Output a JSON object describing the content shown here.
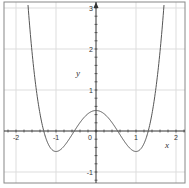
{
  "chart_data": {
    "type": "line",
    "title": "",
    "xlabel": "x",
    "ylabel": "y",
    "function": "y = x^4 - 2x^2 + 0.5",
    "xlim": [
      -2.3,
      2.23
    ],
    "ylim": [
      -1.27,
      3.15
    ],
    "grid": true,
    "x_ticks": [
      -2,
      -1,
      0,
      1,
      2
    ],
    "x_tick_labels": [
      "-2",
      "-1",
      "0",
      "1",
      "2"
    ],
    "y_ticks": [
      -1,
      1,
      2,
      3
    ],
    "y_tick_labels": [
      "-1",
      "1",
      "2",
      "3"
    ],
    "series": [
      {
        "name": "f(x)",
        "color": "#555555",
        "x": [
          -1.72,
          -1.6,
          -1.5,
          -1.4,
          -1.307,
          -1.2,
          -1.1,
          -1.0,
          -0.9,
          -0.8,
          -0.7,
          -0.541,
          -0.4,
          -0.2,
          0.0,
          0.2,
          0.4,
          0.541,
          0.7,
          0.8,
          0.9,
          1.0,
          1.1,
          1.2,
          1.307,
          1.4,
          1.5,
          1.6,
          1.72
        ],
        "y": [
          3.1,
          1.93,
          1.06,
          0.42,
          0.0,
          -0.31,
          -0.46,
          -0.5,
          -0.46,
          -0.37,
          -0.24,
          0.0,
          0.21,
          0.42,
          0.5,
          0.42,
          0.21,
          0.0,
          -0.24,
          -0.37,
          -0.46,
          -0.5,
          -0.46,
          -0.31,
          0.0,
          0.42,
          1.06,
          1.93,
          3.1
        ]
      }
    ],
    "key_points": {
      "local_max": [
        0,
        0.5
      ],
      "local_min": [
        [
          -1,
          -0.5
        ],
        [
          1,
          -0.5
        ]
      ],
      "roots": [
        -1.307,
        -0.541,
        0.541,
        1.307
      ]
    }
  },
  "colors": {
    "frame": "#888888",
    "grid": "#dddddd",
    "axis": "#333333",
    "curve": "#555555"
  }
}
